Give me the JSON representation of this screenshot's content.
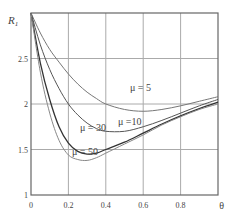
{
  "chart_data": {
    "type": "line",
    "title": "",
    "xlabel": "θ",
    "ylabel": "R1",
    "xlim": [
      0,
      1
    ],
    "ylim": [
      1,
      3
    ],
    "grid": true,
    "x_ticks": [
      "0",
      "0.2",
      "0.4",
      "0.6",
      "0.8"
    ],
    "y_ticks": [
      "1",
      "1.5",
      "2",
      "2.5"
    ],
    "x": [
      0,
      0.05,
      0.1,
      0.15,
      0.2,
      0.25,
      0.3,
      0.35,
      0.4,
      0.5,
      0.6,
      0.7,
      0.8,
      0.9,
      1.0
    ],
    "series": [
      {
        "name": "μ = 5",
        "values": [
          3.0,
          2.78,
          2.6,
          2.46,
          2.33,
          2.22,
          2.13,
          2.06,
          2.0,
          1.94,
          1.92,
          1.94,
          1.98,
          2.03,
          2.08
        ]
      },
      {
        "name": "μ =10",
        "values": [
          3.0,
          2.65,
          2.38,
          2.17,
          2.0,
          1.88,
          1.79,
          1.73,
          1.7,
          1.7,
          1.75,
          1.82,
          1.9,
          1.98,
          2.05
        ]
      },
      {
        "name": "μ = 30",
        "values": [
          3.0,
          2.45,
          2.05,
          1.75,
          1.57,
          1.48,
          1.45,
          1.46,
          1.5,
          1.58,
          1.68,
          1.78,
          1.87,
          1.95,
          2.02
        ]
      },
      {
        "name": "μ = 50",
        "values": [
          3.0,
          2.35,
          1.9,
          1.6,
          1.44,
          1.39,
          1.38,
          1.41,
          1.46,
          1.56,
          1.66,
          1.77,
          1.86,
          1.94,
          2.0
        ]
      }
    ]
  }
}
